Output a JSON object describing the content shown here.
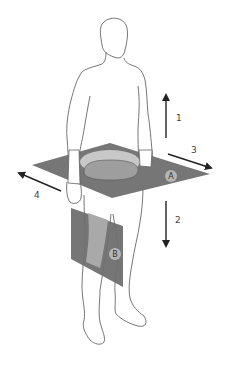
{
  "diagram": {
    "colors": {
      "outline": "#555555",
      "plane_dark": "#6f6f6f",
      "plane_light": "#a9a9a9",
      "cross_section_light": "#c8c8c8",
      "cross_section_mid": "#9e9e9e",
      "arrow": "#222222",
      "label_circle": "#b5b5b5"
    },
    "planes": [
      {
        "id": "A",
        "label": "A",
        "orientation": "horizontal plane through waist"
      },
      {
        "id": "B",
        "label": "B",
        "orientation": "vertical plane through left thigh"
      }
    ],
    "arrows": [
      {
        "id": "1",
        "label": "1",
        "direction": "up"
      },
      {
        "id": "2",
        "label": "2",
        "direction": "down"
      },
      {
        "id": "3",
        "label": "3",
        "direction": "right-down"
      },
      {
        "id": "4",
        "label": "4",
        "direction": "left-up"
      }
    ]
  }
}
